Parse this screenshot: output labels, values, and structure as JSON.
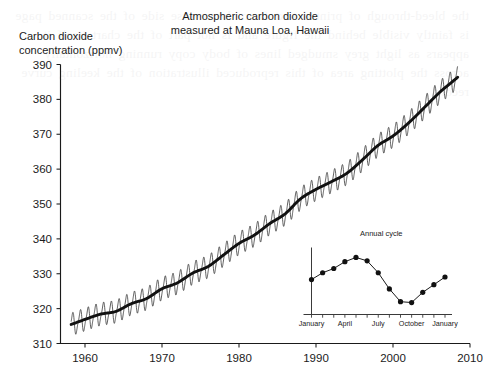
{
  "figure": {
    "title_line1": "Atmospheric carbon dioxide",
    "title_line2": "measured at Mauna Loa, Hawaii",
    "y_axis_label": "Carbon dioxide\nconcentration (ppmv)",
    "background_noise_text": "the bleed-through of printed text from the reverse side of the scanned page is faintly visible behind the figure and is not part of the chart itself it appears as light grey smudged lines of body copy running horizontally across the plotting area of this reproduced illustration of the keeling curve record"
  },
  "chart_data": {
    "type": "line",
    "title": "Atmospheric carbon dioxide measured at Mauna Loa, Hawaii",
    "xlabel": "",
    "ylabel": "Carbon dioxide concentration (ppmv)",
    "xlim": [
      1957,
      2010
    ],
    "ylim": [
      310,
      390
    ],
    "xticks": [
      1960,
      1970,
      1980,
      1990,
      2000,
      2010
    ],
    "yticks": [
      310,
      320,
      330,
      340,
      350,
      360,
      370,
      380,
      390
    ],
    "grid": false,
    "legend": "none",
    "series": [
      {
        "name": "Monthly mean CO2 (seasonal oscillation)",
        "style": "thin-line",
        "note": "Sawtooth annual cycle superimposed on the rising trend, amplitude about +/- 3 ppmv",
        "amplitude_ppmv": 3.0,
        "peak_month": "May",
        "trough_month": "September"
      },
      {
        "name": "Smoothed trend (annual mean)",
        "style": "thick-line",
        "x": [
          1958,
          1960,
          1962,
          1964,
          1966,
          1968,
          1970,
          1972,
          1974,
          1976,
          1978,
          1980,
          1982,
          1984,
          1986,
          1988,
          1990,
          1992,
          1994,
          1996,
          1998,
          2000,
          2002,
          2004,
          2006,
          2008
        ],
        "values": [
          315.3,
          316.9,
          318.4,
          319.2,
          321.4,
          322.9,
          325.7,
          327.4,
          330.2,
          332.1,
          335.4,
          338.7,
          341.1,
          344.4,
          347.2,
          351.5,
          354.2,
          356.4,
          358.8,
          362.6,
          366.7,
          369.5,
          373.2,
          377.5,
          381.9,
          385.6
        ]
      }
    ]
  },
  "inset_chart": {
    "title": "Annual cycle",
    "type": "line",
    "markers": "filled-circle",
    "xticks": [
      "January",
      "April",
      "July",
      "October",
      "January"
    ],
    "categories": [
      "January",
      "February",
      "March",
      "April",
      "May",
      "June",
      "July",
      "August",
      "September",
      "October",
      "November",
      "December",
      "January"
    ],
    "values": [
      -0.2,
      0.6,
      1.1,
      1.9,
      2.4,
      2.0,
      0.6,
      -1.3,
      -2.8,
      -2.9,
      -1.7,
      -0.8,
      0.1
    ],
    "ylabel": "",
    "grid": false,
    "legend": "none"
  }
}
